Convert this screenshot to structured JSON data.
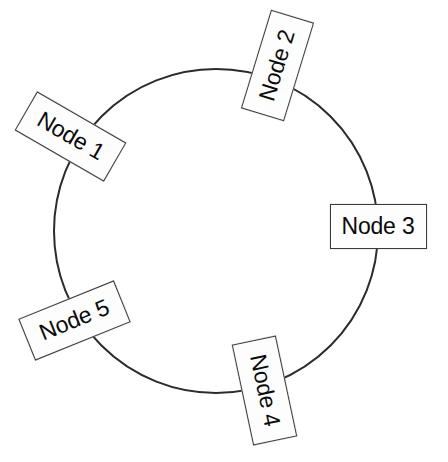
{
  "diagram": {
    "type": "ring-network-diagram",
    "background_color": "#ffffff",
    "stroke_color": "#2b2b2b",
    "label_fill_color": "#fdfdfd",
    "label_border_color": "#3b3b3b",
    "label_text_color": "#0a0a0a",
    "ring": {
      "shape": "circle",
      "center_x": 216,
      "center_y": 231,
      "radius": 162,
      "stroke_width": 2
    },
    "nodes": [
      {
        "id": "node-1",
        "label": "Node 1",
        "center_x": 70,
        "center_y": 136,
        "width": 103,
        "height": 45,
        "rotation_deg": 30
      },
      {
        "id": "node-2",
        "label": "Node 2",
        "center_x": 277,
        "center_y": 65,
        "width": 103,
        "height": 45,
        "rotation_deg": -73
      },
      {
        "id": "node-3",
        "label": "Node 3",
        "center_x": 378,
        "center_y": 226,
        "width": 97,
        "height": 45,
        "rotation_deg": 0
      },
      {
        "id": "node-4",
        "label": "Node 4",
        "center_x": 264,
        "center_y": 390,
        "width": 103,
        "height": 45,
        "rotation_deg": 78
      },
      {
        "id": "node-5",
        "label": "Node 5",
        "center_x": 74,
        "center_y": 320,
        "width": 103,
        "height": 45,
        "rotation_deg": -22
      }
    ]
  }
}
